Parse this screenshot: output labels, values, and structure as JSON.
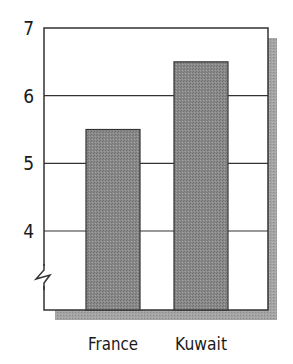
{
  "chart_data": {
    "type": "bar",
    "title": "",
    "xlabel": "",
    "ylabel": "",
    "categories": [
      "France",
      "Kuwait"
    ],
    "values": [
      5.5,
      6.5
    ],
    "ylim": [
      3,
      7
    ],
    "yticks": [
      4,
      5,
      6,
      7
    ],
    "ytick_labels": [
      "4",
      "5",
      "6",
      "7"
    ],
    "grid": true,
    "axis_break": true,
    "legend": null,
    "colors": {
      "bar": "#808080",
      "bar_border": "#333333",
      "shadow": "#9a9a9a",
      "frame": "#333333",
      "gridline": "#333333"
    }
  }
}
